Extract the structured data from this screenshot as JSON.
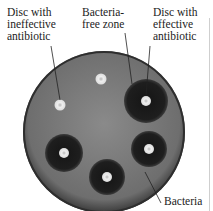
{
  "labels": {
    "ineffective_disc": [
      "Disc with",
      "ineffective",
      "antibiotic"
    ],
    "clear_zone": [
      "Bacteria-",
      "free zone"
    ],
    "effective_disc": [
      "Disc with",
      "effective",
      "antibiotic"
    ],
    "bacteria": "Bacteria"
  },
  "colors": {
    "plate": "#7a7a7a",
    "plate_rim": "#3a3a3a",
    "clear_zone": "#1c1c1c",
    "disc": "#e6e6e6",
    "text": "#222222"
  }
}
